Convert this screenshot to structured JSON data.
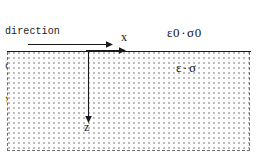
{
  "figure": {
    "type": "physics-diagram",
    "background_color": "#ffffff",
    "line_color": "#1a1a1a",
    "hatch_color": "#b9b9b9",
    "dimensions": {
      "width": 258,
      "height": 158
    }
  },
  "caption": {
    "line1": "direction",
    "line2": "of wave",
    "line3": "transmission"
  },
  "axes": {
    "x_label": "x",
    "z_label": "z",
    "origin_description": "x-axis along interface pointing right, z-axis pointing down into the medium"
  },
  "arrows": {
    "wave_direction": "arrow-right-icon",
    "x_axis": "arrow-right-icon",
    "z_axis": "arrow-down-icon"
  },
  "regions": {
    "upper": {
      "name": "free-space-region",
      "permittivity": "ε0",
      "separator": "·",
      "conductivity": "σ0",
      "label": "ε0 · σ0"
    },
    "lower": {
      "name": "conducting-medium-region",
      "permittivity": "ε",
      "separator": "·",
      "conductivity": "σ",
      "label": "ε · σ",
      "fill_style": "dotted-stipple",
      "border_style": "dashed"
    }
  }
}
